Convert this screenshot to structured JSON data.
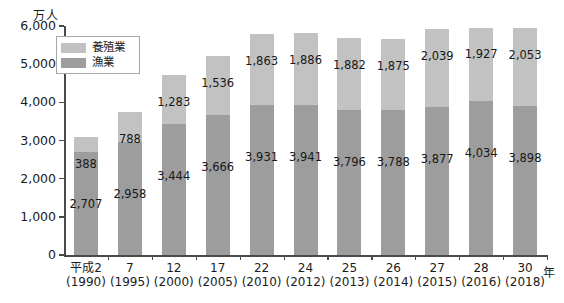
{
  "chart_data": {
    "type": "bar",
    "subtype": "stacked-vertical",
    "title": "",
    "xlabel": "年",
    "ylabel": "万人",
    "ylim": [
      0,
      6000
    ],
    "ytick_step": 1000,
    "grid": false,
    "legend_position": "top-left-inside",
    "categories": [
      "平成2",
      "7",
      "12",
      "17",
      "22",
      "24",
      "25",
      "26",
      "27",
      "28",
      "30"
    ],
    "category_sublabels": [
      "(1990)",
      "(1995)",
      "(2000)",
      "(2005)",
      "(2010)",
      "(2012)",
      "(2013)",
      "(2014)",
      "(2015)",
      "(2016)",
      "(2018)"
    ],
    "ytick_labels": [
      "0",
      "1,000",
      "2,000",
      "3,000",
      "4,000",
      "5,000",
      "6,000"
    ],
    "ytick_values": [
      0,
      1000,
      2000,
      3000,
      4000,
      5000,
      6000
    ],
    "series": [
      {
        "name": "漁業",
        "color": "#9d9d9d",
        "stack_position": "bottom",
        "values": [
          2707,
          2958,
          3444,
          3666,
          3931,
          3941,
          3796,
          3788,
          3877,
          4034,
          3898
        ],
        "labels": [
          "2,707",
          "2,958",
          "3,444",
          "3,666",
          "3,931",
          "3,941",
          "3,796",
          "3,788",
          "3,877",
          "4,034",
          "3,898"
        ]
      },
      {
        "name": "養殖業",
        "color": "#c2c2c2",
        "stack_position": "top",
        "values": [
          388,
          788,
          1283,
          1536,
          1863,
          1886,
          1882,
          1875,
          2039,
          1927,
          2053
        ],
        "labels": [
          "388",
          "788",
          "1,283",
          "1,536",
          "1,863",
          "1,886",
          "1,882",
          "1,875",
          "2,039",
          "1,927",
          "2,053"
        ]
      }
    ],
    "totals": [
      3095,
      3746,
      4727,
      5202,
      5794,
      5827,
      5678,
      5663,
      5916,
      5961,
      5951
    ]
  },
  "legend": {
    "items": [
      {
        "label": "養殖業",
        "color": "#c2c2c2"
      },
      {
        "label": "漁業",
        "color": "#9d9d9d"
      }
    ]
  },
  "axes": {
    "y_unit": "万人",
    "x_unit": "年"
  },
  "colors": {
    "aquaculture": "#c2c2c2",
    "fishery": "#9d9d9d",
    "axis": "#4a4a4a",
    "text": "#181818",
    "background": "#ffffff"
  }
}
